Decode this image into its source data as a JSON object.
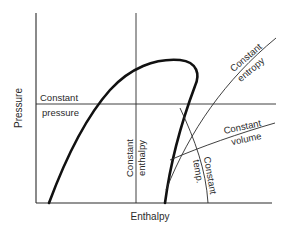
{
  "diagram": {
    "type": "pressure-enthalpy diagram",
    "x_axis_label": "Enthalpy",
    "y_axis_label": "Pressure",
    "lines": {
      "constant_pressure": {
        "line1": "Constant",
        "line2": "pressure"
      },
      "constant_enthalpy": {
        "line1": "Constant",
        "line2": "enthalpy"
      },
      "constant_entropy": {
        "line1": "Constant",
        "line2": "entropy"
      },
      "constant_volume": {
        "line1": "Constant",
        "line2": "volume"
      },
      "constant_temp": {
        "line1": "Constant",
        "line2": "temp."
      }
    },
    "colors": {
      "line": "#2a2a2a",
      "dome": "#111111",
      "background": "#ffffff"
    }
  }
}
